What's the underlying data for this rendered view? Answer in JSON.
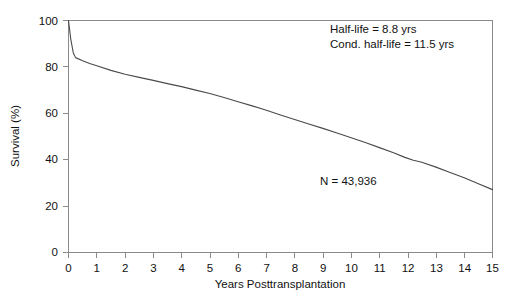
{
  "chart_data": {
    "type": "line",
    "title": "",
    "xlabel": "Years Posttransplantation",
    "ylabel": "Survival (%)",
    "xlim": [
      0,
      15
    ],
    "ylim": [
      0,
      100
    ],
    "grid": false,
    "legend": "none",
    "x_ticks": [
      "0",
      "1",
      "2",
      "3",
      "4",
      "5",
      "6",
      "7",
      "8",
      "9",
      "10",
      "11",
      "12",
      "13",
      "14",
      "15"
    ],
    "y_ticks": [
      "0",
      "20",
      "40",
      "60",
      "80",
      "100"
    ],
    "series": [
      {
        "name": "Survival",
        "color": "#4a4a4a",
        "x": [
          0,
          0.08,
          0.17,
          0.25,
          0.5,
          0.75,
          1,
          1.5,
          2,
          2.5,
          3,
          3.5,
          4,
          4.5,
          5,
          5.5,
          6,
          6.5,
          7,
          7.5,
          8,
          8.5,
          9,
          9.5,
          10,
          10.5,
          11,
          11.5,
          11.9,
          12.2,
          12.5,
          13,
          13.5,
          14,
          14.5,
          15
        ],
        "values": [
          100,
          92,
          86,
          84,
          82.7,
          81.5,
          80.5,
          78.5,
          76.8,
          75.5,
          74.2,
          72.8,
          71.5,
          70,
          68.5,
          66.8,
          65,
          63.2,
          61.3,
          59.3,
          57.3,
          55.4,
          53.5,
          51.5,
          49.5,
          47.4,
          45.2,
          43,
          41,
          39.8,
          38.9,
          36.8,
          34.5,
          32.2,
          29.6,
          27.1
        ]
      }
    ],
    "annotations": [
      {
        "id": "half-life",
        "text": "Half-life = 8.8 yrs",
        "x_px": 330,
        "y_px": 33
      },
      {
        "id": "cond-half-life",
        "text": "Cond. half-life = 11.5 yrs",
        "x_px": 330,
        "y_px": 48
      },
      {
        "id": "sample-size",
        "text": "N = 43,936",
        "x_px": 320,
        "y_px": 185
      }
    ]
  },
  "figure": {
    "caption": ""
  }
}
